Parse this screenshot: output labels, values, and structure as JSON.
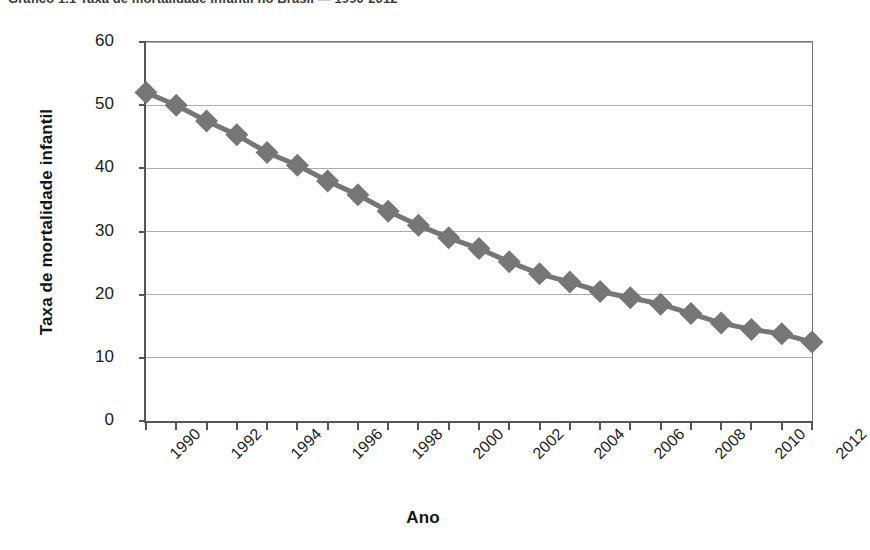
{
  "caption": {
    "text": "Gráfico 1.1   Taxa de mortalidade infantil no Brasil — 1990-2012"
  },
  "axis_title_x": "Ano",
  "axis_title_y": "Taxa de mortalidade infantil",
  "style": {
    "marker_color": "#767676",
    "line_color": "#767676",
    "gridline_color": "#acacac",
    "axis_color": "#555555",
    "text_color": "#1b1b1b",
    "background": "#ffffff"
  },
  "chart_data": {
    "type": "line",
    "title": "",
    "xlabel": "Ano",
    "ylabel": "Taxa de mortalidade infantil",
    "xlim": [
      1990,
      2012
    ],
    "ylim": [
      0,
      60
    ],
    "yticks": [
      0,
      10,
      20,
      30,
      40,
      50,
      60
    ],
    "ytick_labels": [
      "0",
      "10",
      "20",
      "30",
      "40",
      "50",
      "60"
    ],
    "xticks": [
      1990,
      1992,
      1994,
      1996,
      1998,
      2000,
      2002,
      2004,
      2006,
      2008,
      2010,
      2012
    ],
    "xtick_labels": [
      "1990",
      "1992",
      "1994",
      "1996",
      "1998",
      "2000",
      "2002",
      "2004",
      "2006",
      "2008",
      "2010",
      "2012"
    ],
    "xtick_rotation": -45,
    "grid": "horizontal",
    "legend": "none",
    "marker": "diamond",
    "x": [
      1990,
      1991,
      1992,
      1993,
      1994,
      1995,
      1996,
      1997,
      1998,
      1999,
      2000,
      2001,
      2002,
      2003,
      2004,
      2005,
      2006,
      2007,
      2008,
      2009,
      2010,
      2011,
      2012
    ],
    "values": [
      52.0,
      50.0,
      47.5,
      45.3,
      42.5,
      40.5,
      38.0,
      35.8,
      33.2,
      31.0,
      29.0,
      27.3,
      25.2,
      23.3,
      22.0,
      20.5,
      19.5,
      18.5,
      17.0,
      15.5,
      14.5,
      13.8,
      12.5
    ],
    "series": [
      {
        "name": "Taxa de mortalidade infantil",
        "values": [
          52.0,
          50.0,
          47.5,
          45.3,
          42.5,
          40.5,
          38.0,
          35.8,
          33.2,
          31.0,
          29.0,
          27.3,
          25.2,
          23.3,
          22.0,
          20.5,
          19.5,
          18.5,
          17.0,
          15.5,
          14.5,
          13.8,
          12.5
        ]
      }
    ]
  }
}
